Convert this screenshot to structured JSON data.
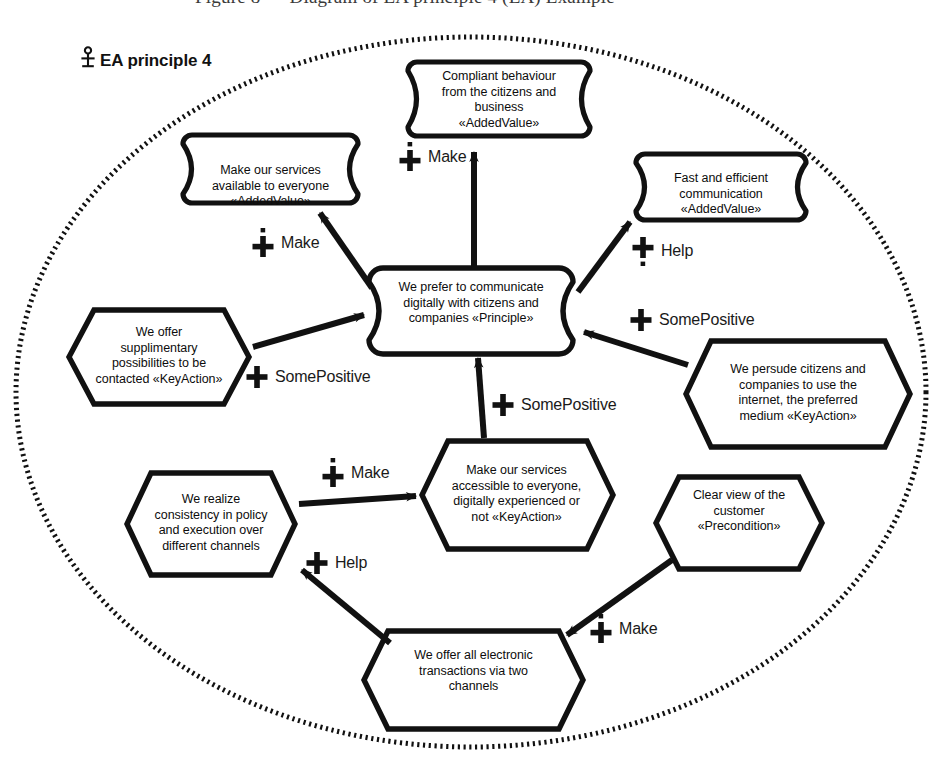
{
  "page": {
    "title_fragment": "Figure 8 — Diagram of EA principle 4 (EA) Example",
    "caption": "EA principle 4",
    "caption_icon": "principle-anchor-icon",
    "background_color": "#ffffff",
    "stroke_color": "#111111",
    "boundary_style": "dashed-ellipse"
  },
  "nodes": [
    {
      "id": "compliant-behaviour",
      "shape": "added-value",
      "lines": [
        "Compliant behaviour",
        "from the citizens and",
        "business",
        "«AddedValue»"
      ],
      "text": "Compliant behaviour from the citizens and business «AddedValue»"
    },
    {
      "id": "make-services-available",
      "shape": "added-value",
      "lines": [
        "Make our services",
        "available to everyone",
        "«AddedValue»"
      ],
      "text": "Make our services available to everyone «AddedValue»"
    },
    {
      "id": "fast-efficient-communication",
      "shape": "added-value",
      "lines": [
        "Fast and efficient",
        "communication",
        "«AddedValue»"
      ],
      "text": "Fast and efficient communication «AddedValue»"
    },
    {
      "id": "prefer-digital-communication",
      "shape": "principle",
      "lines": [
        "We prefer to communicate",
        "digitally with citizens and",
        "companies «Principle»"
      ],
      "text": "We prefer to communicate digitally with citizens and companies «Principle»"
    },
    {
      "id": "supplimentary-possibilities",
      "shape": "hexagon",
      "lines": [
        "We offer",
        "supplimentary",
        "possibilities to be",
        "contacted «KeyAction»"
      ],
      "text": "We offer supplimentary possibilities to be contacted «KeyAction»"
    },
    {
      "id": "persude-citizens-internet",
      "shape": "hexagon",
      "lines": [
        "We persude citizens and",
        "companies to use the",
        "internet, the preferred",
        "medium «KeyAction»"
      ],
      "text": "We persude citizens and companies to use the internet, the preferred medium «KeyAction»"
    },
    {
      "id": "services-accessible-everyone",
      "shape": "hexagon",
      "lines": [
        "Make our services",
        "accessible to everyone,",
        "digitally experienced or",
        "not «KeyAction»"
      ],
      "text": "Make our services accessible to everyone, digitally experienced or not «KeyAction»"
    },
    {
      "id": "consistency-policy-execution",
      "shape": "hexagon",
      "lines": [
        "We realize",
        "consistency in policy",
        "and execution over",
        "different channels"
      ],
      "text": "We realize consistency in policy and execution over different channels"
    },
    {
      "id": "clear-view-customer",
      "shape": "hexagon",
      "lines": [
        "Clear view of the",
        "customer",
        "«Precondition»"
      ],
      "text": "Clear view of the customer «Precondition»"
    },
    {
      "id": "electronic-transactions-two-channels",
      "shape": "hexagon",
      "lines": [
        "We offer all electronic",
        "transactions via two",
        "channels"
      ],
      "text": "We offer all electronic transactions via two channels"
    }
  ],
  "relations": [
    {
      "id": "rel-make-available",
      "label": "Make",
      "icon": "plus-dot-above-icon",
      "from": "prefer-digital-communication",
      "to": "make-services-available"
    },
    {
      "id": "rel-make-compliant",
      "label": "Make",
      "icon": "plus-dot-above-icon",
      "from": "prefer-digital-communication",
      "to": "compliant-behaviour"
    },
    {
      "id": "rel-help-communication",
      "label": "Help",
      "icon": "plus-dot-below-icon",
      "from": "prefer-digital-communication",
      "to": "fast-efficient-communication"
    },
    {
      "id": "rel-somepositive-supplimentary",
      "label": "SomePositive",
      "icon": "plus-icon",
      "from": "supplimentary-possibilities",
      "to": "prefer-digital-communication"
    },
    {
      "id": "rel-somepositive-persude",
      "label": "SomePositive",
      "icon": "plus-icon",
      "from": "persude-citizens-internet",
      "to": "prefer-digital-communication"
    },
    {
      "id": "rel-somepositive-accessible",
      "label": "SomePositive",
      "icon": "plus-icon",
      "from": "services-accessible-everyone",
      "to": "prefer-digital-communication"
    },
    {
      "id": "rel-make-accessible",
      "label": "Make",
      "icon": "plus-dot-above-icon",
      "from": "consistency-policy-execution",
      "to": "services-accessible-everyone"
    },
    {
      "id": "rel-help-consistency",
      "label": "Help",
      "icon": "plus-icon",
      "from": "electronic-transactions-two-channels",
      "to": "consistency-policy-execution"
    },
    {
      "id": "rel-make-transactions",
      "label": "Make",
      "icon": "plus-dot-above-icon",
      "from": "clear-view-customer",
      "to": "electronic-transactions-two-channels"
    }
  ]
}
